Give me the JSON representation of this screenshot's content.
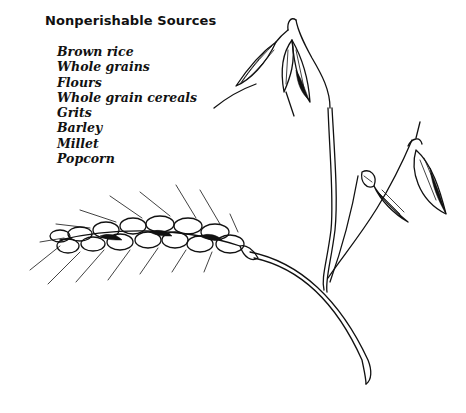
{
  "heading": "Nonperishable Sources",
  "items": [
    "Brown rice",
    "Whole grains",
    "Flours",
    "Whole grain cereals",
    "Grits",
    "Barley",
    "Millet",
    "Popcorn"
  ],
  "illustrations": {
    "oat": "oat-plant-illustration",
    "wheat": "wheat-ear-illustration"
  },
  "colors": {
    "ink": "#111111",
    "background": "#ffffff"
  }
}
